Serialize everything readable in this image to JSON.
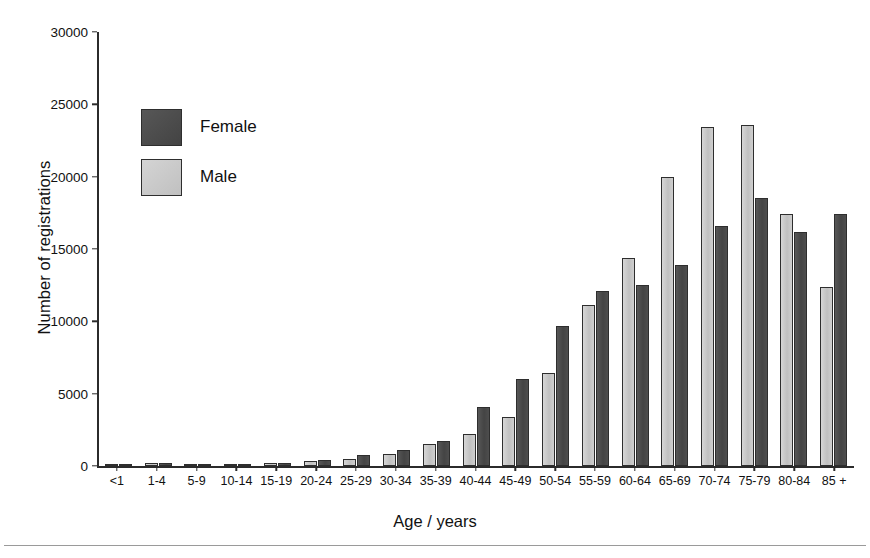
{
  "chart_data": {
    "type": "bar",
    "title": "",
    "xlabel": "Age / years",
    "ylabel": "Number of registrations",
    "ylim": [
      0,
      30000
    ],
    "yticks": [
      0,
      5000,
      10000,
      15000,
      20000,
      25000,
      30000
    ],
    "ytick_labels": [
      "0",
      "5000",
      "10000",
      "15000",
      "20000",
      "25000",
      "30000"
    ],
    "grid": false,
    "legend_position": "upper-left-inside",
    "categories": [
      "<1",
      "1-4",
      "5-9",
      "10-14",
      "15-19",
      "20-24",
      "25-29",
      "30-34",
      "35-39",
      "40-44",
      "45-49",
      "50-54",
      "55-59",
      "60-64",
      "65-69",
      "70-74",
      "75-79",
      "80-84",
      "85 +"
    ],
    "series": [
      {
        "name": "Male",
        "color": "#c6c6c6",
        "values": [
          60,
          230,
          150,
          160,
          230,
          330,
          500,
          830,
          1500,
          2200,
          3400,
          6400,
          11100,
          14400,
          20000,
          23400,
          23600,
          17400,
          12400
        ]
      },
      {
        "name": "Female",
        "color": "#4b4b4b",
        "values": [
          50,
          180,
          130,
          130,
          190,
          400,
          750,
          1100,
          1700,
          4100,
          6000,
          9700,
          12100,
          12500,
          13900,
          16600,
          18500,
          16200,
          17400
        ]
      }
    ]
  },
  "legend": {
    "entries": [
      {
        "label": "Female",
        "swatch": "female"
      },
      {
        "label": "Male",
        "swatch": "male"
      }
    ]
  }
}
